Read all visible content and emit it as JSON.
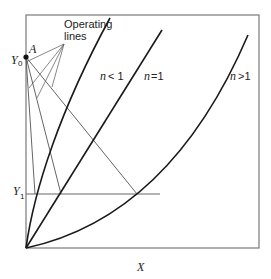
{
  "diagram": {
    "labels": {
      "operating_lines_line1": "Operating",
      "operating_lines_line2": "lines",
      "point_a": "A",
      "y0_main": "Y",
      "y0_sub": "0",
      "y1_main": "Y",
      "y1_sub": "1",
      "x_axis": "X",
      "curve_n_less_1_n": "n",
      "curve_n_less_1_rel": "< 1",
      "curve_n_eq_1_n": "n",
      "curve_n_eq_1_rel": "=1",
      "curve_n_greater_1_n": "n",
      "curve_n_greater_1_rel": ">1"
    },
    "curves": [
      {
        "name": "n<1",
        "shape": "concave"
      },
      {
        "name": "n=1",
        "shape": "straight"
      },
      {
        "name": "n>1",
        "shape": "convex"
      }
    ],
    "operating_line_count": 3,
    "colors": {
      "curve": "#1a1a1a",
      "operating_line": "#555555",
      "frame": "#7a7a7a"
    }
  }
}
